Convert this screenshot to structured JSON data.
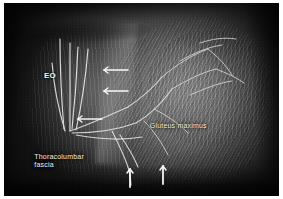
{
  "figure": {
    "type": "anatomical-dissection-photograph",
    "region": "lumbar and gluteal region",
    "rendering": "grayscale",
    "border_color": "#ffffff",
    "label_color": "#f2f2f2"
  },
  "labels": [
    {
      "id": "eo",
      "text": "EO",
      "meaning": "external oblique",
      "x_pct": 14.5,
      "y_pct": 35.5
    },
    {
      "id": "thoracolumbar_fascia",
      "text": "Thoracolumbar\nfascia",
      "x_pct": 11,
      "y_pct": 77.5
    },
    {
      "id": "gluteus_maximus",
      "text": "Gluteus maximus",
      "x_pct": 53,
      "y_pct": 61.5
    }
  ],
  "markers": {
    "arrow_color": "#ffffff",
    "pointer_arrows": [
      {
        "id": "arrow-upper-1",
        "direction": "left",
        "x_pct": 40,
        "y_pct": 35
      },
      {
        "id": "arrow-upper-2",
        "direction": "left",
        "x_pct": 40,
        "y_pct": 46
      },
      {
        "id": "arrow-mid-3",
        "direction": "left",
        "x_pct": 33,
        "y_pct": 60
      },
      {
        "id": "arrow-bottom-1",
        "direction": "up",
        "x_pct": 46,
        "y_pct": 88
      },
      {
        "id": "arrow-bottom-2",
        "direction": "up",
        "x_pct": 58,
        "y_pct": 86
      }
    ],
    "highlighted_structures": "cutaneous nerve and vessel branches traced in white"
  }
}
